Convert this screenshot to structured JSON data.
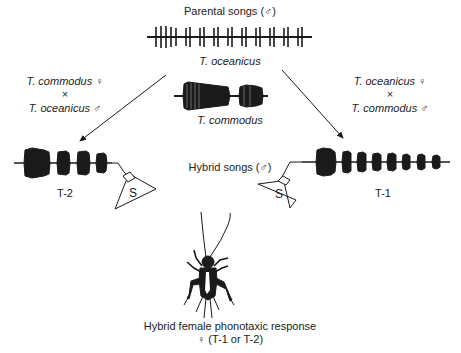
{
  "title": "Parental songs (♂)",
  "parents": {
    "oceanicus": {
      "label": "T. oceanicus"
    },
    "commodus": {
      "label": "T. commodus"
    }
  },
  "crosses": {
    "left": {
      "female": "T. commodus ♀",
      "times": "×",
      "male": "T. oceanicus ♂"
    },
    "right": {
      "female": "T. oceanicus ♀",
      "times": "×",
      "male": "T. commodus ♂"
    }
  },
  "hybrid_songs_label": "Hybrid songs (♂)",
  "hybrids": {
    "left": {
      "label": "T-2",
      "speaker": "S"
    },
    "right": {
      "label": "T-1",
      "speaker": "S"
    }
  },
  "response": {
    "line1": "Hybrid female phonotaxic response",
    "line2": "♀ (T-1 or T-2)"
  },
  "colors": {
    "ink": "#1a1a1a",
    "background": "#ffffff"
  }
}
